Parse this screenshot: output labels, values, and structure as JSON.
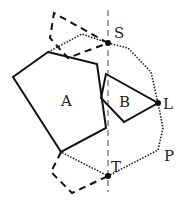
{
  "diagram": {
    "labels": {
      "A": "A",
      "B": "B",
      "S": "S",
      "T": "T",
      "L": "L",
      "P": "P"
    },
    "colors": {
      "stroke": "#111111",
      "axis": "#555555",
      "background": "#ffffff"
    },
    "points": {
      "S": [
        108,
        43
      ],
      "T": [
        108,
        176
      ],
      "L": [
        158,
        103
      ]
    },
    "axis": {
      "type": "vertical-dashed-line",
      "x": 108,
      "y1": 10,
      "y2": 192
    },
    "polygons": {
      "A": [
        [
          48,
          52
        ],
        [
          97,
          64
        ],
        [
          106,
          128
        ],
        [
          61,
          152
        ],
        [
          13,
          77
        ]
      ],
      "B": [
        [
          106,
          74
        ],
        [
          158,
          103
        ],
        [
          124,
          122
        ],
        [
          101,
          98
        ]
      ]
    },
    "dashed_upper": [
      [
        108,
        43
      ],
      [
        54,
        13
      ],
      [
        50,
        38
      ],
      [
        68,
        58
      ],
      [
        108,
        43
      ]
    ],
    "dashed_lower": [
      [
        61,
        152
      ],
      [
        51,
        172
      ],
      [
        72,
        193
      ],
      [
        108,
        176
      ]
    ],
    "dotted_boundary": [
      [
        48,
        52
      ],
      [
        82,
        34
      ],
      [
        108,
        43
      ],
      [
        128,
        48
      ],
      [
        151,
        72
      ],
      [
        158,
        103
      ],
      [
        163,
        128
      ],
      [
        158,
        150
      ],
      [
        108,
        176
      ],
      [
        61,
        152
      ]
    ]
  }
}
